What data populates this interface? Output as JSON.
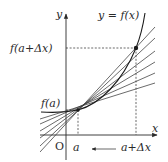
{
  "diagram": {
    "colors": {
      "ink": "#2a2a2a",
      "secant": "#3a3a3a",
      "background": "#ffffff"
    },
    "axes": {
      "x_label": "x",
      "y_label": "y",
      "origin_label": "O"
    },
    "curve_label": "y = f(x)",
    "labels": {
      "f_a": "f(a)",
      "f_a_dx": "f(a+Δx)",
      "a": "a",
      "a_dx": "a+Δx"
    },
    "points": [
      {
        "name": "P",
        "description": "(a, f(a))"
      },
      {
        "name": "Q",
        "description": "(a+Δx, f(a+Δx))"
      }
    ],
    "secant_count": 6,
    "arrow_annotation": "arrow from a+Δx pointing toward a"
  }
}
